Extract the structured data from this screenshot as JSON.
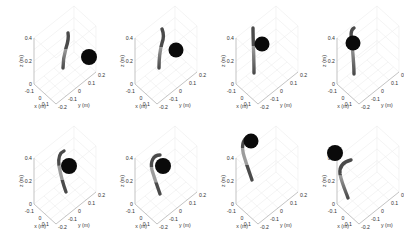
{
  "figure": {
    "layout": {
      "rows": 2,
      "cols": 4
    },
    "colors": {
      "background": "#ffffff",
      "axis": "#9a9a9a",
      "grid": "#ececec",
      "sphere": "#0a0a0a",
      "segment_dark": "#4a4a4a",
      "segment_light": "#9c9c9c"
    }
  },
  "chart_data": [
    {
      "type": "scatter",
      "panel": 1,
      "title": "",
      "xlabel": "x (m)",
      "ylabel": "y (m)",
      "zlabel": "z (m)",
      "x_ticks": [
        "-0.1",
        "0",
        "0.1"
      ],
      "y_ticks": [
        "-0.2",
        "-0.1",
        "0",
        "0.1",
        "0.2"
      ],
      "z_ticks": [
        "0",
        "0.2",
        "0.4"
      ],
      "zlim": [
        0,
        0.4
      ],
      "grid": true,
      "arm_shape": "nearly straight, slight bend near top",
      "target_sphere": "right of arm, mid-height"
    },
    {
      "type": "scatter",
      "panel": 2,
      "title": "",
      "xlabel": "x (m)",
      "ylabel": "y (m)",
      "zlabel": "z (m)",
      "x_ticks": [
        "-0.1",
        "0",
        "0.1"
      ],
      "y_ticks": [
        "-0.2",
        "-0.1",
        "0",
        "0.1",
        "0.2"
      ],
      "z_ticks": [
        "0",
        "0.2",
        "0.4"
      ],
      "zlim": [
        0,
        0.4
      ],
      "grid": true,
      "arm_shape": "slight S-bend",
      "target_sphere": "right of arm, upper"
    },
    {
      "type": "scatter",
      "panel": 3,
      "title": "",
      "xlabel": "x (m)",
      "ylabel": "y (m)",
      "zlabel": "z (m)",
      "x_ticks": [
        "-0.1",
        "0",
        "0.1"
      ],
      "y_ticks": [
        "-0.2",
        "-0.1",
        "0",
        "0.1",
        "0.2"
      ],
      "z_ticks": [
        "0",
        "0.2",
        "0.4"
      ],
      "zlim": [
        0,
        0.4
      ],
      "grid": true,
      "arm_shape": "vertical straight",
      "target_sphere": "overlapping arm, upper"
    },
    {
      "type": "scatter",
      "panel": 4,
      "title": "",
      "xlabel": "x (m)",
      "ylabel": "y (m)",
      "zlabel": "z (m)",
      "x_ticks": [
        "-0.1",
        "0",
        "0.1"
      ],
      "y_ticks": [
        "-0.2",
        "-0.1",
        "0",
        "0.1",
        "0.2"
      ],
      "z_ticks": [
        "0",
        "0.2",
        "0.4"
      ],
      "zlim": [
        0,
        0.4
      ],
      "grid": true,
      "arm_shape": "vertical, hook at top",
      "target_sphere": "overlapping arm, upper"
    },
    {
      "type": "scatter",
      "panel": 5,
      "title": "",
      "xlabel": "x (m)",
      "ylabel": "y (m)",
      "zlabel": "z (m)",
      "x_ticks": [
        "-0.1",
        "0",
        "0.1"
      ],
      "y_ticks": [
        "-0.2",
        "-0.1",
        "0",
        "0.1",
        "0.2"
      ],
      "z_ticks": [
        "0",
        "0.2",
        "0.4"
      ],
      "zlim": [
        0,
        0.4
      ],
      "grid": true,
      "arm_shape": "curved top hooking right",
      "target_sphere": "right of arm tip"
    },
    {
      "type": "scatter",
      "panel": 6,
      "title": "",
      "xlabel": "x (m)",
      "ylabel": "y (m)",
      "zlabel": "z (m)",
      "x_ticks": [
        "-0.1",
        "0",
        "0.1"
      ],
      "y_ticks": [
        "-0.2",
        "-0.1",
        "0",
        "0.1",
        "0.2"
      ],
      "z_ticks": [
        "0",
        "0.2",
        "0.4"
      ],
      "zlim": [
        0,
        0.4
      ],
      "grid": true,
      "arm_shape": "C-curve, tip toward sphere",
      "target_sphere": "at arm tip"
    },
    {
      "type": "scatter",
      "panel": 7,
      "title": "",
      "xlabel": "x (m)",
      "ylabel": "y (m)",
      "zlabel": "z (m)",
      "x_ticks": [
        "-0.1",
        "0",
        "0.1"
      ],
      "y_ticks": [
        "-0.2",
        "-0.1",
        "0",
        "0.1",
        "0.2"
      ],
      "z_ticks": [
        "0",
        "0.2",
        "0.4"
      ],
      "zlim": [
        0,
        0.4
      ],
      "grid": true,
      "arm_shape": "strong curve wrapping sphere",
      "target_sphere": "grasped at tip"
    },
    {
      "type": "scatter",
      "panel": 8,
      "title": "",
      "xlabel": "x (m)",
      "ylabel": "y (m)",
      "zlabel": "z (m)",
      "x_ticks": [
        "-0.1",
        "0",
        "0.1"
      ],
      "y_ticks": [
        "-0.2",
        "-0.1",
        "0",
        "0.1",
        "0.2"
      ],
      "z_ticks": [
        "0",
        "0.2",
        "0.4"
      ],
      "zlim": [
        0,
        0.4
      ],
      "grid": true,
      "arm_shape": "curved, released",
      "target_sphere": "above-left of arm, detached"
    }
  ],
  "labels": {
    "x": "x (m)",
    "y": "y (m)",
    "z": "z (m)",
    "z_ticks": [
      "0",
      "0.2",
      "0.4"
    ],
    "x_ticks": [
      "-0.1",
      "0",
      "0.1"
    ],
    "y_ticks": [
      "-0.2",
      "-0.1",
      "0",
      "0.1",
      "0.2"
    ]
  }
}
